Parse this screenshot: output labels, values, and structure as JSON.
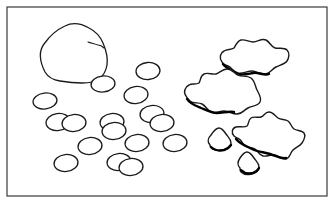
{
  "figure": {
    "title": "Line drawing of a boulder, scattered pebbles and puddles",
    "caption": "",
    "canvas": {
      "width": 335,
      "height": 208
    },
    "background_color": "#ffffff",
    "ink_color": "#1a1a1a",
    "shadow_color": "#000000"
  },
  "frame": {
    "name": "picture-border",
    "x": 7,
    "y": 7,
    "width": 320,
    "height": 189,
    "stroke_color": "#3a3a3a",
    "stroke_width": 1.2,
    "fill_color": "#ffffff"
  },
  "shapes": {
    "boulder": {
      "label": "large rock",
      "stroke_width": 1.3,
      "outline": "M 45 72 C 40 62 38 52 44 44 C 49 37 56 30 65 26 C 73 22 82 24 89 28 C 95 31 100 36 103 43 C 106 50 108 58 107 65 C 106 71 103 76 99 79 C 95 82 88 83 82 83 C 74 83 66 82 60 81 C 53 80 48 77 45 72 Z",
      "crack": "M 88 42 C 91 43 95 44 98 45 C 100 45 102 46 104 48"
    },
    "pebbles": [
      {
        "id": "p1",
        "cx": 103,
        "cy": 84,
        "rx": 12,
        "ry": 8,
        "rot": -6
      },
      {
        "id": "p2",
        "cx": 148,
        "cy": 71,
        "rx": 12,
        "ry": 8.5,
        "rot": -4
      },
      {
        "id": "p3",
        "cx": 45,
        "cy": 101,
        "rx": 12,
        "ry": 8,
        "rot": -7
      },
      {
        "id": "p4",
        "cx": 136,
        "cy": 95,
        "rx": 12,
        "ry": 8.5,
        "rot": -8
      },
      {
        "id": "p5",
        "cx": 58,
        "cy": 122,
        "rx": 12,
        "ry": 8.5,
        "rot": -8
      },
      {
        "id": "p6",
        "cx": 74,
        "cy": 123,
        "rx": 12,
        "ry": 8.5,
        "rot": -6
      },
      {
        "id": "p7",
        "cx": 112,
        "cy": 122,
        "rx": 12,
        "ry": 8.5,
        "rot": -6
      },
      {
        "id": "p8",
        "cx": 114,
        "cy": 131,
        "rx": 12,
        "ry": 8.5,
        "rot": -5
      },
      {
        "id": "p9",
        "cx": 152,
        "cy": 114,
        "rx": 12,
        "ry": 8.5,
        "rot": -7
      },
      {
        "id": "p10",
        "cx": 162,
        "cy": 123,
        "rx": 12,
        "ry": 8.5,
        "rot": -6
      },
      {
        "id": "p11",
        "cx": 90,
        "cy": 146,
        "rx": 12,
        "ry": 8.5,
        "rot": -6
      },
      {
        "id": "p12",
        "cx": 137,
        "cy": 143,
        "rx": 12,
        "ry": 8.5,
        "rot": -6
      },
      {
        "id": "p13",
        "cx": 66,
        "cy": 163,
        "rx": 12,
        "ry": 8.5,
        "rot": -6
      },
      {
        "id": "p14",
        "cx": 119,
        "cy": 162,
        "rx": 12,
        "ry": 8.5,
        "rot": -6
      },
      {
        "id": "p15",
        "cx": 131,
        "cy": 167,
        "rx": 12,
        "ry": 8.5,
        "rot": -6
      },
      {
        "id": "p16",
        "cx": 175,
        "cy": 143,
        "rx": 12,
        "ry": 8.5,
        "rot": -6
      }
    ],
    "puddles": [
      {
        "id": "puddle-top-right",
        "label": "upper right puddle",
        "outline": "M 222 62 C 219 58 220 53 224 51 C 227 49 231 50 234 48 C 236 45 237 41 241 40 C 245 39 249 42 253 42 C 258 42 261 38 266 40 C 270 42 271 47 275 48 C 279 49 284 47 287 50 C 290 53 289 58 287 61 C 285 64 280 65 276 67 C 272 69 270 73 266 74 C 261 75 257 71 252 71 C 247 71 243 74 238 73 C 234 72 232 68 228 66 C 225 65 223 64 222 62 Z",
        "shadow": "M 223 64 C 226 68 231 70 236 73 C 241 76 247 74 253 73 C 259 72 264 76 269 74"
      },
      {
        "id": "puddle-middle",
        "label": "middle puddle",
        "outline": "M 186 96 C 183 92 185 87 189 85 C 192 83 196 85 199 83 C 201 80 200 76 204 74 C 208 72 212 75 216 74 C 220 73 222 69 227 69 C 232 69 234 73 238 75 C 242 77 247 75 251 78 C 255 81 255 86 257 90 C 259 94 262 98 260 102 C 258 106 252 106 248 108 C 244 110 242 114 237 114 C 232 114 229 111 224 111 C 219 111 215 114 211 112 C 207 110 206 106 202 104 C 198 102 193 104 190 101 C 188 99 187 98 186 96 Z",
        "shadow": "M 187 99 C 190 104 196 106 201 108 C 206 110 211 113 217 113 C 223 113 228 111 234 112"
      },
      {
        "id": "puddle-bottom-right",
        "label": "lower right splat puddle",
        "outline": "M 234 136 C 231 133 232 128 236 127 C 240 126 244 128 247 126 C 249 124 248 120 251 118 C 254 116 258 118 261 117 C 264 116 265 112 269 112 C 273 112 275 116 278 118 C 281 120 285 119 288 121 C 291 123 291 127 294 129 C 297 131 302 130 304 133 C 306 136 304 140 302 143 C 300 146 296 147 293 150 C 290 153 290 158 286 159 C 282 160 279 156 275 155 C 271 154 267 157 263 156 C 259 155 258 151 255 149 C 252 147 248 148 245 146 C 242 144 242 140 239 139 C 237 138 235 137 234 136 Z",
        "shadow": "M 236 139 C 240 144 246 146 252 149 C 258 152 264 152 270 154 C 276 156 281 159 286 158"
      }
    ],
    "droplets": [
      {
        "id": "droplet-left",
        "label": "small droplet",
        "outline": "M 210 145 C 207 142 208 138 211 135 C 213 132 216 128 219 128 C 222 128 224 131 226 134 C 228 137 231 139 231 143 C 231 147 228 149 224 150 C 220 151 216 151 213 149 C 211 148 210 147 210 145 Z",
        "shadow": "M 211 147 C 214 150 219 151 224 150 C 227 149 229 148 231 145"
      },
      {
        "id": "droplet-right",
        "label": "small droplet lower",
        "outline": "M 240 168 C 237 165 238 161 240 158 C 242 155 244 152 247 152 C 250 152 252 155 254 158 C 256 161 259 163 259 167 C 259 171 255 173 251 174 C 247 175 243 174 241 172 C 240 171 240 169 240 168 Z",
        "shadow": "M 241 170 C 244 173 249 174 253 173 C 256 172 258 170 259 168"
      }
    ]
  }
}
